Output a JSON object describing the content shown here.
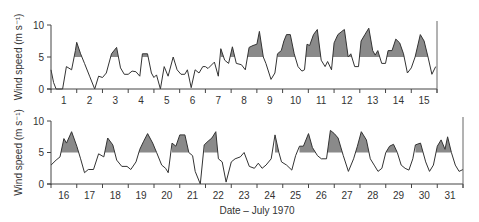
{
  "chart_data": [
    {
      "type": "line",
      "panel": "top",
      "title": "",
      "xlabel": "",
      "ylabel": "Wind speed (m s⁻¹)",
      "ylim": [
        0,
        10
      ],
      "yticks": [
        0,
        5,
        10
      ],
      "xtick_labels": [
        "1",
        "2",
        "3",
        "4",
        "5",
        "6",
        "7",
        "8",
        "9",
        "10",
        "11",
        "12",
        "13",
        "14",
        "15"
      ],
      "day_range": [
        1,
        15
      ],
      "threshold": 5,
      "shade_above_threshold": true,
      "points": [
        [
          0.0,
          3.0
        ],
        [
          0.1,
          1.0
        ],
        [
          0.2,
          0.0
        ],
        [
          0.45,
          0.0
        ],
        [
          0.6,
          3.5
        ],
        [
          0.8,
          3.0
        ],
        [
          0.95,
          6.0
        ],
        [
          1.0,
          7.3
        ],
        [
          1.15,
          5.5
        ],
        [
          1.3,
          4.0
        ],
        [
          1.5,
          2.0
        ],
        [
          1.7,
          0.0
        ],
        [
          1.85,
          2.0
        ],
        [
          2.0,
          1.8
        ],
        [
          2.15,
          2.5
        ],
        [
          2.35,
          5.5
        ],
        [
          2.55,
          6.5
        ],
        [
          2.7,
          3.3
        ],
        [
          2.85,
          2.3
        ],
        [
          3.0,
          2.3
        ],
        [
          3.15,
          2.8
        ],
        [
          3.3,
          2.7
        ],
        [
          3.45,
          2.0
        ],
        [
          3.55,
          5.5
        ],
        [
          3.75,
          5.5
        ],
        [
          3.9,
          2.5
        ],
        [
          4.0,
          1.8
        ],
        [
          4.1,
          2.2
        ],
        [
          4.25,
          0.0
        ],
        [
          4.4,
          3.5
        ],
        [
          4.55,
          2.0
        ],
        [
          4.75,
          5.0
        ],
        [
          4.9,
          3.0
        ],
        [
          5.05,
          2.3
        ],
        [
          5.2,
          2.3
        ],
        [
          5.3,
          3.0
        ],
        [
          5.45,
          0.2
        ],
        [
          5.6,
          3.0
        ],
        [
          5.75,
          2.5
        ],
        [
          5.9,
          3.5
        ],
        [
          6.0,
          3.5
        ],
        [
          6.1,
          3.2
        ],
        [
          6.35,
          4.2
        ],
        [
          6.5,
          2.0
        ],
        [
          6.6,
          6.3
        ],
        [
          6.75,
          4.5
        ],
        [
          6.9,
          4.0
        ],
        [
          7.05,
          6.6
        ],
        [
          7.2,
          4.0
        ],
        [
          7.4,
          3.8
        ],
        [
          7.55,
          3.0
        ],
        [
          7.7,
          6.5
        ],
        [
          7.85,
          6.8
        ],
        [
          8.0,
          7.0
        ],
        [
          8.1,
          9.0
        ],
        [
          8.25,
          5.0
        ],
        [
          8.35,
          4.0
        ],
        [
          8.55,
          1.5
        ],
        [
          8.7,
          2.5
        ],
        [
          8.8,
          5.5
        ],
        [
          8.95,
          6.0
        ],
        [
          9.05,
          7.5
        ],
        [
          9.15,
          8.5
        ],
        [
          9.3,
          8.5
        ],
        [
          9.45,
          5.5
        ],
        [
          9.6,
          3.5
        ],
        [
          9.75,
          2.8
        ],
        [
          9.85,
          3.0
        ],
        [
          9.95,
          7.0
        ],
        [
          10.05,
          6.8
        ],
        [
          10.2,
          8.5
        ],
        [
          10.35,
          9.3
        ],
        [
          10.5,
          4.5
        ],
        [
          10.65,
          3.5
        ],
        [
          10.75,
          4.3
        ],
        [
          10.9,
          3.0
        ],
        [
          11.0,
          7.2
        ],
        [
          11.15,
          8.5
        ],
        [
          11.3,
          9.0
        ],
        [
          11.4,
          9.3
        ],
        [
          11.55,
          5.0
        ],
        [
          11.65,
          5.5
        ],
        [
          11.8,
          3.5
        ],
        [
          11.95,
          3.5
        ],
        [
          12.05,
          7.5
        ],
        [
          12.2,
          8.5
        ],
        [
          12.35,
          9.5
        ],
        [
          12.5,
          6.0
        ],
        [
          12.6,
          5.3
        ],
        [
          12.7,
          6.0
        ],
        [
          12.85,
          4.0
        ],
        [
          13.0,
          4.0
        ],
        [
          13.1,
          6.0
        ],
        [
          13.25,
          6.0
        ],
        [
          13.4,
          7.8
        ],
        [
          13.55,
          7.2
        ],
        [
          13.7,
          5.5
        ],
        [
          13.85,
          2.5
        ],
        [
          14.0,
          3.3
        ],
        [
          14.15,
          5.0
        ],
        [
          14.35,
          8.5
        ],
        [
          14.5,
          7.5
        ],
        [
          14.65,
          5.0
        ],
        [
          14.8,
          2.3
        ],
        [
          14.95,
          3.5
        ],
        [
          15.1,
          5.5
        ],
        [
          15.25,
          6.3
        ],
        [
          15.45,
          9.5
        ],
        [
          15.6,
          4.0
        ],
        [
          15.8,
          2.3
        ],
        [
          15.95,
          4.0
        ],
        [
          16.1,
          6.5
        ],
        [
          16.25,
          6.8
        ],
        [
          16.4,
          5.5
        ],
        [
          16.55,
          3.0
        ],
        [
          16.65,
          2.8
        ]
      ]
    },
    {
      "type": "line",
      "panel": "bottom",
      "title": "",
      "xlabel": "Date – July 1970",
      "ylabel": "Wind speed (m s⁻¹)",
      "ylim": [
        0,
        10
      ],
      "yticks": [
        0,
        5,
        10
      ],
      "xtick_labels": [
        "16",
        "17",
        "18",
        "19",
        "20",
        "21",
        "22",
        "23",
        "24",
        "25",
        "26",
        "27",
        "28",
        "29",
        "30",
        "31"
      ],
      "day_range": [
        16,
        31
      ],
      "threshold": 5,
      "shade_above_threshold": true,
      "points": [
        [
          0.0,
          3.0
        ],
        [
          0.2,
          3.8
        ],
        [
          0.35,
          4.3
        ],
        [
          0.5,
          7.2
        ],
        [
          0.6,
          6.5
        ],
        [
          0.8,
          8.3
        ],
        [
          1.0,
          6.0
        ],
        [
          1.15,
          4.0
        ],
        [
          1.3,
          1.8
        ],
        [
          1.45,
          2.3
        ],
        [
          1.65,
          2.3
        ],
        [
          1.85,
          4.8
        ],
        [
          2.05,
          4.3
        ],
        [
          2.2,
          7.3
        ],
        [
          2.4,
          6.2
        ],
        [
          2.55,
          3.8
        ],
        [
          2.75,
          2.8
        ],
        [
          2.95,
          2.8
        ],
        [
          3.1,
          2.3
        ],
        [
          3.3,
          3.5
        ],
        [
          3.45,
          5.5
        ],
        [
          3.6,
          6.8
        ],
        [
          3.75,
          8.0
        ],
        [
          3.95,
          6.5
        ],
        [
          4.1,
          5.0
        ],
        [
          4.3,
          3.0
        ],
        [
          4.45,
          2.5
        ],
        [
          4.55,
          1.8
        ],
        [
          4.7,
          6.5
        ],
        [
          4.85,
          6.0
        ],
        [
          5.0,
          7.8
        ],
        [
          5.2,
          7.8
        ],
        [
          5.35,
          5.0
        ],
        [
          5.5,
          4.5
        ],
        [
          5.6,
          2.0
        ],
        [
          5.8,
          0.0
        ],
        [
          5.95,
          6.2
        ],
        [
          6.1,
          6.8
        ],
        [
          6.25,
          7.3
        ],
        [
          6.4,
          8.3
        ],
        [
          6.5,
          4.0
        ],
        [
          6.65,
          3.5
        ],
        [
          6.8,
          0.3
        ],
        [
          7.0,
          3.5
        ],
        [
          7.15,
          4.0
        ],
        [
          7.35,
          4.3
        ],
        [
          7.5,
          5.0
        ],
        [
          7.7,
          2.8
        ],
        [
          7.9,
          2.5
        ],
        [
          8.05,
          3.3
        ],
        [
          8.2,
          2.5
        ],
        [
          8.35,
          3.0
        ],
        [
          8.55,
          4.0
        ],
        [
          8.7,
          7.8
        ],
        [
          8.85,
          5.0
        ],
        [
          8.95,
          3.5
        ],
        [
          9.15,
          3.0
        ],
        [
          9.35,
          2.2
        ],
        [
          9.5,
          4.5
        ],
        [
          9.65,
          6.0
        ],
        [
          9.8,
          6.0
        ],
        [
          10.0,
          8.0
        ],
        [
          10.15,
          5.8
        ],
        [
          10.35,
          4.5
        ],
        [
          10.5,
          4.0
        ],
        [
          10.7,
          4.0
        ],
        [
          10.85,
          8.5
        ],
        [
          11.0,
          8.0
        ],
        [
          11.15,
          7.3
        ],
        [
          11.35,
          4.5
        ],
        [
          11.55,
          2.0
        ],
        [
          11.75,
          4.0
        ],
        [
          11.9,
          6.0
        ],
        [
          12.05,
          8.3
        ],
        [
          12.25,
          7.0
        ],
        [
          12.4,
          4.0
        ],
        [
          12.55,
          3.0
        ],
        [
          12.7,
          2.0
        ],
        [
          12.85,
          2.5
        ],
        [
          13.0,
          5.0
        ],
        [
          13.15,
          6.0
        ],
        [
          13.3,
          6.3
        ],
        [
          13.45,
          5.0
        ],
        [
          13.6,
          3.0
        ],
        [
          13.75,
          2.5
        ],
        [
          13.9,
          2.2
        ],
        [
          14.05,
          4.0
        ],
        [
          14.15,
          6.2
        ],
        [
          14.35,
          6.5
        ],
        [
          14.55,
          3.5
        ],
        [
          14.7,
          2.0
        ],
        [
          14.85,
          3.0
        ],
        [
          15.0,
          6.0
        ],
        [
          15.15,
          7.0
        ],
        [
          15.3,
          5.5
        ],
        [
          15.4,
          7.5
        ],
        [
          15.55,
          5.0
        ],
        [
          15.7,
          3.0
        ],
        [
          15.85,
          2.0
        ],
        [
          16.0,
          2.3
        ],
        [
          16.2,
          5.0
        ],
        [
          16.4,
          8.0
        ],
        [
          16.6,
          7.0
        ],
        [
          16.75,
          4.5
        ],
        [
          16.9,
          2.5
        ],
        [
          17.0,
          0.0
        ],
        [
          17.15,
          3.5
        ],
        [
          17.3,
          6.5
        ],
        [
          17.45,
          7.5
        ],
        [
          17.6,
          7.0
        ],
        [
          17.75,
          4.0
        ],
        [
          17.9,
          3.0
        ],
        [
          18.05,
          1.5
        ],
        [
          18.2,
          4.0
        ],
        [
          18.4,
          6.0
        ],
        [
          18.6,
          7.0
        ],
        [
          18.8,
          5.0
        ],
        [
          18.95,
          3.0
        ],
        [
          19.05,
          2.0
        ],
        [
          19.2,
          5.0
        ],
        [
          19.4,
          6.0
        ],
        [
          19.55,
          6.0
        ],
        [
          19.65,
          6.5
        ],
        [
          19.8,
          7.5
        ],
        [
          19.95,
          5.0
        ],
        [
          20.0,
          4.0
        ]
      ]
    }
  ],
  "figure": {
    "xlabel": "Date – July 1970",
    "ylabel": "Wind speed (m s⁻¹)",
    "fill_color": "#8a8a8a",
    "line_color": "#333333"
  }
}
